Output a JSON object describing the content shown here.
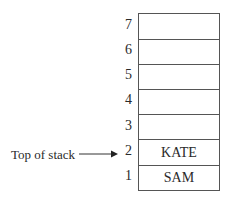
{
  "diagram": {
    "type": "stack",
    "pointer_label": "Top of stack",
    "pointer_target_index": "2",
    "slots": [
      {
        "index": "7",
        "value": ""
      },
      {
        "index": "6",
        "value": ""
      },
      {
        "index": "5",
        "value": ""
      },
      {
        "index": "4",
        "value": ""
      },
      {
        "index": "3",
        "value": ""
      },
      {
        "index": "2",
        "value": "KATE"
      },
      {
        "index": "1",
        "value": "SAM"
      }
    ]
  }
}
